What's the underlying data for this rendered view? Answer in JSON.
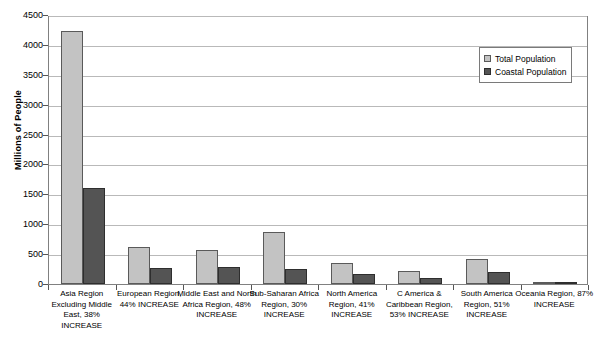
{
  "chart_data": {
    "type": "bar",
    "title": "",
    "subtitle": "",
    "xlabel": "",
    "ylabel": "Millions of People",
    "ylim": [
      0,
      4500
    ],
    "ytick_step": 500,
    "yticks": [
      0,
      500,
      1000,
      1500,
      2000,
      2500,
      3000,
      3500,
      4000,
      4500
    ],
    "ytick_labels": [
      "0",
      "500",
      "1000",
      "1500",
      "2000",
      "2500",
      "3000",
      "3500",
      "4000",
      "4500"
    ],
    "grid": true,
    "grid_axis": "y",
    "legend_position": "top-right",
    "categories": [
      "Asia Region Excluding Middle East, 38% INCREASE",
      "European Region, 44% INCREASE",
      "Middle East and North Africa Region, 48% INCREASE",
      "Sub-Saharan Africa Region, 30% INCREASE",
      "North America Region, 41% INCREASE",
      "C America & Caribbean Region, 53% INCREASE",
      "South America Region, 51% INCREASE",
      "Oceania Region, 87% INCREASE"
    ],
    "series": [
      {
        "name": "Total Population",
        "color": "#c3c3c3",
        "values": [
          4230,
          620,
          570,
          870,
          350,
          215,
          420,
          32
        ]
      },
      {
        "name": "Coastal Population",
        "color": "#545454",
        "values": [
          1600,
          265,
          285,
          250,
          160,
          100,
          195,
          22
        ]
      }
    ]
  },
  "legend": {
    "items": [
      {
        "label": "Total Population"
      },
      {
        "label": "Coastal Population"
      }
    ]
  },
  "axes": {
    "y_title": "Millions of People"
  }
}
